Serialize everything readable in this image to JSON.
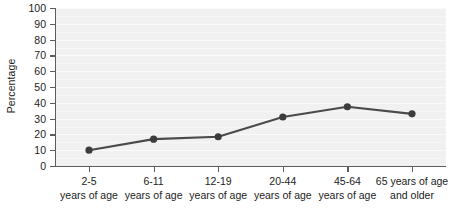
{
  "chart_data": {
    "type": "line",
    "title": "",
    "xlabel": "",
    "ylabel": "Percentage",
    "ylim": [
      0,
      100
    ],
    "yticks": [
      0,
      10,
      20,
      30,
      40,
      50,
      60,
      70,
      80,
      90,
      100
    ],
    "grid": true,
    "legend": "none",
    "categories": [
      "2-5\nyears of age",
      "6-11\nyears of age",
      "12-19\nyears of age",
      "20-44\nyears of age",
      "45-64\nyears of age",
      "65 years of age\nand older"
    ],
    "category_lines": [
      [
        "2-5",
        "years of age"
      ],
      [
        "6-11",
        "years of age"
      ],
      [
        "12-19",
        "years of age"
      ],
      [
        "20-44",
        "years of age"
      ],
      [
        "45-64",
        "years of age"
      ],
      [
        "65 years of age",
        "and older"
      ]
    ],
    "values": [
      10,
      17,
      18.5,
      31,
      37.5,
      33
    ],
    "series": [
      {
        "name": "Percentage",
        "values": [
          10,
          17,
          18.5,
          31,
          37.5,
          33
        ]
      }
    ],
    "colors": {
      "line": "#4a4a4a",
      "marker": "#3c3c3c",
      "plot_background": "#f1f1f1",
      "gridline": "#fbfbfb",
      "axis": "#5c5c5c",
      "text": "#1c1c1c",
      "figure_background": "#ffffff"
    }
  }
}
